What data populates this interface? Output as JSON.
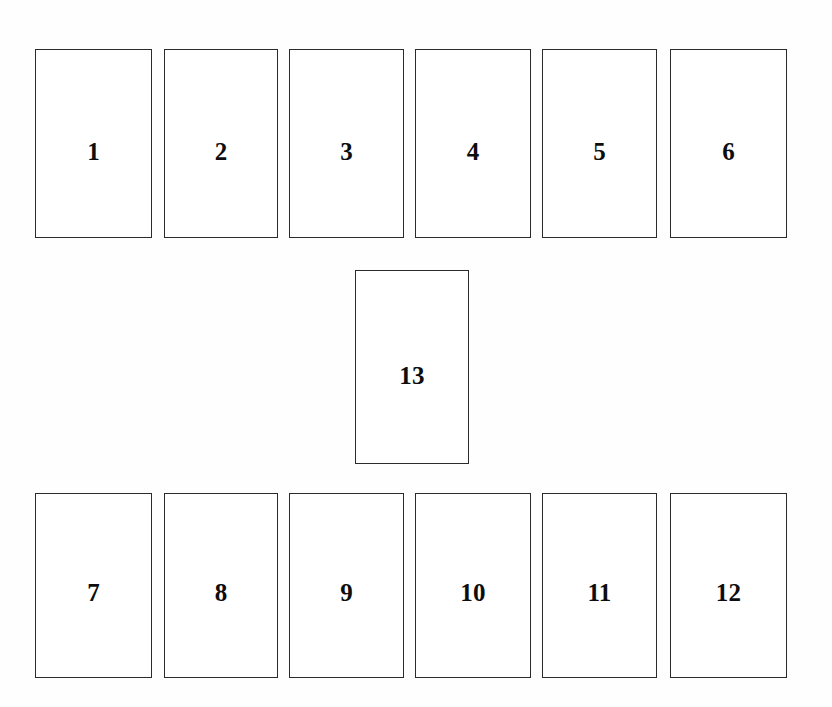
{
  "canvas": {
    "width": 832,
    "height": 707,
    "background_color": "#fefefe",
    "border_color": "#2b2b2b",
    "card_fill_color": "#ffffff",
    "label_color": "#0d0d0d"
  },
  "diagram": {
    "title": "",
    "rows": [
      {
        "name": "top-row",
        "cards": [
          {
            "label": "1",
            "x": 35,
            "y": 49,
            "w": 117,
            "h": 189
          },
          {
            "label": "2",
            "x": 164,
            "y": 49,
            "w": 114,
            "h": 189
          },
          {
            "label": "3",
            "x": 289,
            "y": 49,
            "w": 115,
            "h": 189
          },
          {
            "label": "4",
            "x": 415,
            "y": 49,
            "w": 116,
            "h": 189
          },
          {
            "label": "5",
            "x": 542,
            "y": 49,
            "w": 115,
            "h": 189
          },
          {
            "label": "6",
            "x": 670,
            "y": 49,
            "w": 117,
            "h": 189
          }
        ]
      },
      {
        "name": "middle-row",
        "cards": [
          {
            "label": "13",
            "x": 355,
            "y": 270,
            "w": 114,
            "h": 194
          }
        ]
      },
      {
        "name": "bottom-row",
        "cards": [
          {
            "label": "7",
            "x": 35,
            "y": 493,
            "w": 117,
            "h": 185
          },
          {
            "label": "8",
            "x": 164,
            "y": 493,
            "w": 114,
            "h": 185
          },
          {
            "label": "9",
            "x": 289,
            "y": 493,
            "w": 115,
            "h": 185
          },
          {
            "label": "10",
            "x": 415,
            "y": 493,
            "w": 116,
            "h": 185
          },
          {
            "label": "11",
            "x": 542,
            "y": 493,
            "w": 115,
            "h": 185
          },
          {
            "label": "12",
            "x": 670,
            "y": 493,
            "w": 117,
            "h": 185
          }
        ]
      }
    ]
  }
}
